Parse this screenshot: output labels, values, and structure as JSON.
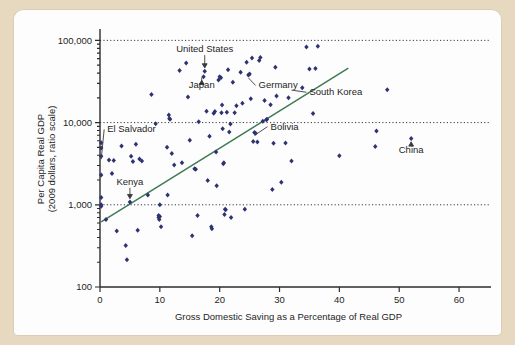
{
  "chart_data": {
    "type": "scatter",
    "title": "",
    "xlabel": "Gross Domestic Saving as a Percentage of Real GDP",
    "ylabel_line1": "Per Capita Real GDP",
    "ylabel_line2": "(2009 dollars, ratio scale)",
    "yscale": "log",
    "xlim": [
      0,
      63
    ],
    "ylim": [
      100,
      130000
    ],
    "xticks": [
      0,
      10,
      20,
      30,
      40,
      50,
      60
    ],
    "xticklabels": [
      "0",
      "10",
      "20",
      "30",
      "40",
      "50",
      "60"
    ],
    "yticks": [
      100,
      1000,
      10000,
      100000
    ],
    "yticklabels": [
      "100",
      "1,000",
      "10,000",
      "100,000"
    ],
    "gridlines_y": [
      1000,
      10000,
      100000
    ],
    "grid": "horizontal-dotted",
    "legend": "none",
    "point_color": "#2e3270",
    "trendline_color": "#3f7a53",
    "trendline": {
      "label": "regression line",
      "x_start": 0.2,
      "y_start": 620,
      "x_end": 41.5,
      "y_end": 46000
    },
    "annotations": [
      {
        "label": "United States",
        "marker": "down-arrow",
        "text_x": 17.5,
        "text_y": 72000,
        "point_x": 17.5,
        "point_y": 42000
      },
      {
        "label": "Japan",
        "marker": "up-arrow",
        "text_x": 17.0,
        "text_y": 26000,
        "point_x": 17.3,
        "point_y": 36000
      },
      {
        "label": "Germany",
        "marker": "leader-line",
        "text_x": 26.5,
        "text_y": 26000,
        "point_x": 24.8,
        "point_y": 38000
      },
      {
        "label": "South Korea",
        "marker": "leader-line",
        "text_x": 35.0,
        "text_y": 21500,
        "point_x": 32.0,
        "point_y": 27000
      },
      {
        "label": "Bolivia",
        "marker": "leader-line",
        "text_x": 28.5,
        "text_y": 8200,
        "point_x": 25.8,
        "point_y": 7600
      },
      {
        "label": "El Salvador",
        "marker": "leader-line",
        "text_x": 1.2,
        "text_y": 7600,
        "point_x": 0.2,
        "point_y": 3900
      },
      {
        "label": "Kenya",
        "marker": "down-arrow",
        "text_x": 5.0,
        "text_y": 1750,
        "point_x": 5.0,
        "point_y": 1080
      },
      {
        "label": "China",
        "marker": "up-arrow",
        "text_x": 52.0,
        "text_y": 4300,
        "point_x": 52.0,
        "point_y": 6400
      }
    ],
    "points": [
      [
        0.2,
        5700
      ],
      [
        0.2,
        4900
      ],
      [
        0.2,
        3900
      ],
      [
        0.2,
        2300
      ],
      [
        0.2,
        1230
      ],
      [
        0.2,
        1000
      ],
      [
        0.2,
        960
      ],
      [
        1.0,
        660
      ],
      [
        1.5,
        3500
      ],
      [
        2.0,
        2400
      ],
      [
        2.3,
        3450
      ],
      [
        2.8,
        480
      ],
      [
        3.6,
        5200
      ],
      [
        4.3,
        320
      ],
      [
        4.5,
        215
      ],
      [
        5.0,
        1080
      ],
      [
        5.2,
        3900
      ],
      [
        5.5,
        3350
      ],
      [
        6.0,
        5450
      ],
      [
        6.3,
        490
      ],
      [
        6.6,
        3600
      ],
      [
        7.0,
        3400
      ],
      [
        8.0,
        1320
      ],
      [
        8.6,
        22000
      ],
      [
        9.3,
        9700
      ],
      [
        9.8,
        740
      ],
      [
        9.8,
        700
      ],
      [
        9.9,
        660
      ],
      [
        10.0,
        1000
      ],
      [
        10.0,
        720
      ],
      [
        10.2,
        540
      ],
      [
        11.2,
        5000
      ],
      [
        11.3,
        1320
      ],
      [
        11.5,
        12400
      ],
      [
        11.6,
        11200
      ],
      [
        11.7,
        11000
      ],
      [
        12.0,
        4200
      ],
      [
        12.4,
        3050
      ],
      [
        13.3,
        43000
      ],
      [
        13.7,
        3250
      ],
      [
        14.4,
        53000
      ],
      [
        14.7,
        20500
      ],
      [
        15.0,
        6100
      ],
      [
        15.4,
        420
      ],
      [
        15.8,
        2750
      ],
      [
        16.0,
        2700
      ],
      [
        16.3,
        740
      ],
      [
        16.5,
        10200
      ],
      [
        17.3,
        36000
      ],
      [
        17.5,
        42000
      ],
      [
        17.8,
        13700
      ],
      [
        18.0,
        1980
      ],
      [
        18.3,
        6800
      ],
      [
        18.6,
        540
      ],
      [
        18.7,
        510
      ],
      [
        19.0,
        13000
      ],
      [
        19.2,
        13600
      ],
      [
        19.4,
        4400
      ],
      [
        19.5,
        1700
      ],
      [
        19.8,
        33000
      ],
      [
        20.0,
        36000
      ],
      [
        20.2,
        35000
      ],
      [
        20.3,
        13200
      ],
      [
        20.4,
        16400
      ],
      [
        20.5,
        8400
      ],
      [
        20.6,
        3150
      ],
      [
        20.7,
        3250
      ],
      [
        20.8,
        760
      ],
      [
        20.9,
        880
      ],
      [
        21.0,
        870
      ],
      [
        21.2,
        13400
      ],
      [
        21.4,
        44000
      ],
      [
        21.6,
        7700
      ],
      [
        21.8,
        9600
      ],
      [
        21.9,
        700
      ],
      [
        22.2,
        31000
      ],
      [
        22.5,
        13200
      ],
      [
        22.8,
        16000
      ],
      [
        23.5,
        41000
      ],
      [
        23.8,
        17200
      ],
      [
        24.2,
        880
      ],
      [
        24.5,
        54000
      ],
      [
        24.8,
        38000
      ],
      [
        25.0,
        39000
      ],
      [
        25.2,
        19500
      ],
      [
        25.4,
        61000
      ],
      [
        25.6,
        5900
      ],
      [
        25.8,
        7600
      ],
      [
        26.0,
        7400
      ],
      [
        26.3,
        5800
      ],
      [
        26.6,
        57000
      ],
      [
        26.8,
        62000
      ],
      [
        27.2,
        10400
      ],
      [
        27.5,
        18500
      ],
      [
        27.8,
        10800
      ],
      [
        27.9,
        11000
      ],
      [
        28.5,
        16500
      ],
      [
        28.8,
        1530
      ],
      [
        29.0,
        5600
      ],
      [
        29.3,
        47000
      ],
      [
        29.5,
        21000
      ],
      [
        30.3,
        1880
      ],
      [
        31.0,
        5650
      ],
      [
        31.5,
        20000
      ],
      [
        32.0,
        3400
      ],
      [
        33.8,
        26500
      ],
      [
        34.5,
        83000
      ],
      [
        35.0,
        45000
      ],
      [
        35.6,
        12900
      ],
      [
        36.0,
        45500
      ],
      [
        36.4,
        85000
      ],
      [
        40.0,
        3950
      ],
      [
        46.0,
        5100
      ],
      [
        46.2,
        7900
      ],
      [
        48.0,
        25000
      ],
      [
        52.0,
        6400
      ]
    ]
  }
}
